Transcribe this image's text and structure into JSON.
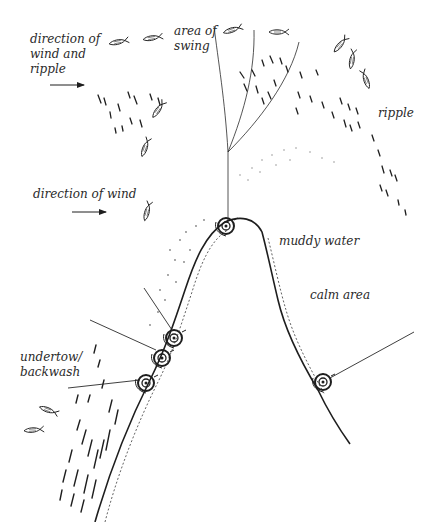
{
  "diagram": {
    "type": "fishing-bank-illustration",
    "ink_color": "#1e1e1e",
    "background_color": "#ffffff",
    "labels": {
      "wind_and_ripple": "direction of\nwind and\nripple",
      "area_of_swing": "area of\nswing",
      "ripple": "ripple",
      "direction_of_wind": "direction of wind",
      "muddy_water": "muddy water",
      "calm_area": "calm area",
      "undertow": "undertow/\nbackwash"
    },
    "arrows": [
      {
        "name": "wind-and-ripple-arrow",
        "x1": 50,
        "y1": 85,
        "x2": 84,
        "y2": 85
      },
      {
        "name": "wind-arrow",
        "x1": 72,
        "y1": 212,
        "x2": 106,
        "y2": 212
      }
    ],
    "anglers": [
      {
        "name": "angler-top",
        "x": 226,
        "y": 226
      },
      {
        "name": "angler-left-1",
        "x": 172,
        "y": 336
      },
      {
        "name": "angler-left-2",
        "x": 161,
        "y": 357
      },
      {
        "name": "angler-left-3",
        "x": 144,
        "y": 383
      },
      {
        "name": "angler-right",
        "x": 323,
        "y": 382
      }
    ],
    "fish_count": 13
  }
}
